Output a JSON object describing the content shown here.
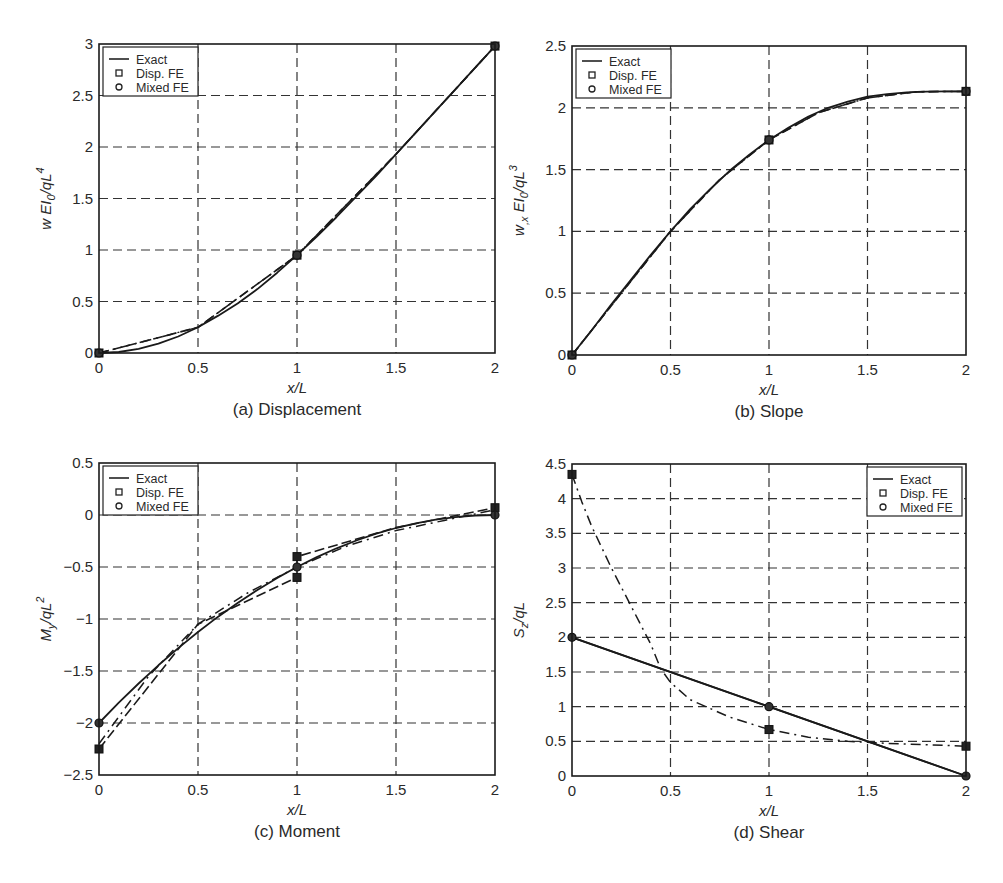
{
  "figure": {
    "footer_caption": ""
  },
  "legend": [
    "Exact",
    "Disp. FE",
    "Mixed FE"
  ],
  "chart_data": [
    {
      "id": "a",
      "type": "line",
      "caption": "(a) Displacement",
      "xlabel": "x/L",
      "ylabel": "w EI0/qL^4",
      "ylabel_parts": {
        "main": "w EI",
        "sub": "0",
        "mid": "/qL",
        "sup": "4"
      },
      "xlim": [
        0,
        2
      ],
      "ylim": [
        0,
        3
      ],
      "xticks": [
        0,
        0.5,
        1,
        1.5,
        2
      ],
      "yticks": [
        0,
        0.5,
        1,
        1.5,
        2,
        2.5,
        3
      ],
      "grid": true,
      "legend_position": "upper-left",
      "box": {
        "left": 99,
        "right": 495,
        "top": 44,
        "bottom": 353
      },
      "series": [
        {
          "name": "Exact",
          "style": "solid",
          "x": [
            0,
            0.1,
            0.2,
            0.3,
            0.4,
            0.5,
            0.6,
            0.7,
            0.8,
            0.9,
            1.0,
            1.1,
            1.2,
            1.3,
            1.4,
            1.5,
            1.6,
            1.7,
            1.8,
            1.9,
            2.0
          ],
          "y": [
            0,
            0.01,
            0.04,
            0.09,
            0.16,
            0.25,
            0.36,
            0.48,
            0.62,
            0.78,
            0.95,
            1.13,
            1.32,
            1.52,
            1.72,
            1.93,
            2.14,
            2.35,
            2.56,
            2.77,
            2.98
          ]
        },
        {
          "name": "Disp. FE",
          "style": "dashed",
          "x": [
            0,
            0.5,
            1.0,
            1.5,
            2.0
          ],
          "y": [
            0,
            0.25,
            0.95,
            1.93,
            2.98
          ]
        },
        {
          "name": "Mixed FE",
          "style": "dashdot",
          "x": [
            0,
            0.5,
            1.0,
            1.5,
            2.0
          ],
          "y": [
            0,
            0.25,
            0.95,
            1.93,
            2.98
          ]
        }
      ],
      "markers": [
        {
          "series": "Disp. FE",
          "shape": "square",
          "x": [
            0,
            1,
            2
          ],
          "y": [
            0,
            0.95,
            2.98
          ]
        },
        {
          "series": "Mixed FE",
          "shape": "circle",
          "x": [
            0,
            1,
            2
          ],
          "y": [
            0,
            0.95,
            2.98
          ]
        }
      ]
    },
    {
      "id": "b",
      "type": "line",
      "caption": "(b) Slope",
      "xlabel": "x/L",
      "ylabel": "w,x EI0/qL^3",
      "ylabel_parts": {
        "main": "w",
        "sub1": ",x",
        "mid0": " EI",
        "sub": "0",
        "mid": "/qL",
        "sup": "3"
      },
      "xlim": [
        0,
        2
      ],
      "ylim": [
        0,
        2.5
      ],
      "xticks": [
        0,
        0.5,
        1,
        1.5,
        2
      ],
      "yticks": [
        0,
        0.5,
        1,
        1.5,
        2,
        2.5
      ],
      "grid": true,
      "legend_position": "upper-left",
      "box": {
        "left": 572,
        "right": 966,
        "top": 46,
        "bottom": 355
      },
      "series": [
        {
          "name": "Exact",
          "style": "solid",
          "x": [
            0,
            0.1,
            0.2,
            0.3,
            0.4,
            0.5,
            0.6,
            0.7,
            0.8,
            0.9,
            1.0,
            1.1,
            1.2,
            1.3,
            1.4,
            1.5,
            1.6,
            1.7,
            1.8,
            1.9,
            2.0
          ],
          "y": [
            0,
            0.2,
            0.41,
            0.61,
            0.81,
            1.0,
            1.18,
            1.34,
            1.49,
            1.62,
            1.74,
            1.84,
            1.93,
            2.0,
            2.05,
            2.09,
            2.11,
            2.125,
            2.13,
            2.133,
            2.133
          ]
        },
        {
          "name": "Disp. FE",
          "style": "dashed",
          "x": [
            0,
            0.25,
            0.5,
            0.75,
            1.0,
            1.25,
            1.5,
            1.75,
            2.0
          ],
          "y": [
            0,
            0.5,
            1.0,
            1.42,
            1.74,
            1.96,
            2.08,
            2.13,
            2.133
          ]
        },
        {
          "name": "Mixed FE",
          "style": "dashdot",
          "x": [
            0,
            0.25,
            0.5,
            0.75,
            1.0,
            1.25,
            1.5,
            1.75,
            2.0
          ],
          "y": [
            0,
            0.5,
            1.0,
            1.42,
            1.74,
            1.96,
            2.08,
            2.13,
            2.133
          ]
        }
      ],
      "markers": [
        {
          "series": "Disp. FE",
          "shape": "square",
          "x": [
            0,
            1,
            2
          ],
          "y": [
            0,
            1.74,
            2.133
          ]
        },
        {
          "series": "Mixed FE",
          "shape": "circle",
          "x": [
            0,
            1,
            2
          ],
          "y": [
            0,
            1.74,
            2.133
          ]
        }
      ]
    },
    {
      "id": "c",
      "type": "line",
      "caption": "(c) Moment",
      "xlabel": "x/L",
      "ylabel": "My/qL^2",
      "ylabel_parts": {
        "main": "M",
        "sub": "y",
        "mid": "/qL",
        "sup": "2"
      },
      "xlim": [
        0,
        2
      ],
      "ylim": [
        -2.5,
        0.5
      ],
      "xticks": [
        0,
        0.5,
        1,
        1.5,
        2
      ],
      "yticks": [
        -2.5,
        -2,
        -1.5,
        -1,
        -0.5,
        0,
        0.5
      ],
      "ytick_labels": [
        "−2.5",
        "−2",
        "−1.5",
        "−1",
        "−0.5",
        "0",
        "0.5"
      ],
      "grid": true,
      "legend_position": "upper-left",
      "box": {
        "left": 99,
        "right": 495,
        "top": 463,
        "bottom": 775
      },
      "series": [
        {
          "name": "Exact",
          "style": "solid",
          "x": [
            0,
            0.1,
            0.2,
            0.3,
            0.4,
            0.5,
            0.6,
            0.7,
            0.8,
            0.9,
            1.0,
            1.1,
            1.2,
            1.3,
            1.4,
            1.5,
            1.6,
            1.7,
            1.8,
            1.9,
            2.0
          ],
          "y": [
            -2.0,
            -1.805,
            -1.62,
            -1.445,
            -1.28,
            -1.125,
            -0.98,
            -0.845,
            -0.72,
            -0.605,
            -0.5,
            -0.405,
            -0.32,
            -0.245,
            -0.18,
            -0.125,
            -0.08,
            -0.045,
            -0.02,
            -0.005,
            0
          ]
        },
        {
          "name": "Disp. FE",
          "style": "dashed",
          "x": [
            0,
            0.5,
            1.0,
            1.0,
            1.5,
            2.0
          ],
          "y": [
            -2.25,
            -1.05,
            -0.6,
            -0.4,
            -0.12,
            0.07
          ]
        },
        {
          "name": "Mixed FE",
          "style": "dashdot",
          "x": [
            0,
            0.25,
            0.5,
            0.75,
            1.0,
            1.25,
            1.5,
            1.75,
            2.0
          ],
          "y": [
            -2.2,
            -1.55,
            -1.05,
            -0.75,
            -0.5,
            -0.3,
            -0.15,
            -0.05,
            0.05
          ]
        }
      ],
      "markers": [
        {
          "series": "Disp. FE",
          "shape": "square",
          "x": [
            0,
            1,
            1,
            2
          ],
          "y": [
            -2.25,
            -0.4,
            -0.6,
            0.07
          ]
        },
        {
          "series": "Mixed FE",
          "shape": "circle",
          "x": [
            0,
            1,
            2
          ],
          "y": [
            -2.0,
            -0.5,
            0
          ]
        }
      ]
    },
    {
      "id": "d",
      "type": "line",
      "caption": "(d) Shear",
      "xlabel": "x/L",
      "ylabel": "Sz/qL",
      "ylabel_parts": {
        "main": "S",
        "sub": "z",
        "mid": "/qL",
        "sup": ""
      },
      "xlim": [
        0,
        2
      ],
      "ylim": [
        0,
        4.5
      ],
      "xticks": [
        0,
        0.5,
        1,
        1.5,
        2
      ],
      "yticks": [
        0,
        0.5,
        1,
        1.5,
        2,
        2.5,
        3,
        3.5,
        4,
        4.5
      ],
      "grid": true,
      "legend_position": "upper-right",
      "box": {
        "left": 572,
        "right": 966,
        "top": 464,
        "bottom": 776
      },
      "series": [
        {
          "name": "Exact",
          "style": "solid",
          "x": [
            0,
            2
          ],
          "y": [
            2.0,
            0
          ]
        },
        {
          "name": "Disp. FE",
          "style": "dashdot",
          "x": [
            0,
            0.05,
            0.1,
            0.2,
            0.3,
            0.4,
            0.45,
            0.5,
            0.6,
            0.8,
            1.0,
            1.2,
            1.4,
            1.6,
            1.8,
            2.0
          ],
          "y": [
            4.35,
            3.95,
            3.6,
            3.0,
            2.45,
            1.9,
            1.55,
            1.35,
            1.1,
            0.85,
            0.67,
            0.56,
            0.5,
            0.47,
            0.45,
            0.43
          ]
        },
        {
          "name": "Mixed FE",
          "style": "solid-overlap",
          "x": [
            0,
            1,
            2
          ],
          "y": [
            2.0,
            1.0,
            0
          ]
        }
      ],
      "markers": [
        {
          "series": "Disp. FE",
          "shape": "square",
          "x": [
            0,
            1,
            2
          ],
          "y": [
            4.35,
            0.67,
            0.43
          ]
        },
        {
          "series": "Mixed FE",
          "shape": "circle",
          "x": [
            0,
            1,
            2
          ],
          "y": [
            2.0,
            1.0,
            0
          ]
        }
      ]
    }
  ]
}
